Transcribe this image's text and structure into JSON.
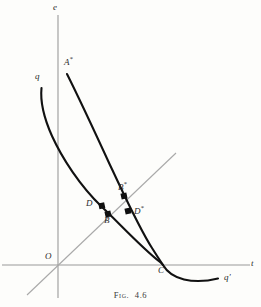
{
  "figure": {
    "caption_prefix": "Fig.",
    "caption_number": "4.6",
    "axes": {
      "x_label": "t",
      "y_label": "e",
      "origin_label": "O"
    },
    "curve_labels": {
      "q": "q",
      "q_prime": "q′"
    },
    "points": [
      {
        "id": "A-star",
        "label": "A",
        "star": "*",
        "x": 64,
        "y": 62
      },
      {
        "id": "B-star",
        "label": "B",
        "star": "*",
        "x": 118,
        "y": 186
      },
      {
        "id": "D",
        "label": "D",
        "star": "",
        "x": 86,
        "y": 204
      },
      {
        "id": "D-star",
        "label": "D",
        "star": "*",
        "x": 134,
        "y": 210
      },
      {
        "id": "B",
        "label": "B",
        "star": "",
        "x": 104,
        "y": 221
      },
      {
        "id": "C",
        "label": "C",
        "star": "",
        "x": 158,
        "y": 271
      }
    ],
    "markers": [
      {
        "id": "marker-D",
        "cx": 102,
        "cy": 206
      },
      {
        "id": "marker-B-star",
        "cx": 124,
        "cy": 196
      },
      {
        "id": "marker-B",
        "cx": 108,
        "cy": 214
      },
      {
        "id": "marker-D-star",
        "cx": 128,
        "cy": 211
      }
    ],
    "colors": {
      "curve": "#111111",
      "axis": "#9a9a9a",
      "diagonal": "#a9a9a9",
      "text": "#2a2a2a",
      "background": "#fdfdfb"
    }
  }
}
